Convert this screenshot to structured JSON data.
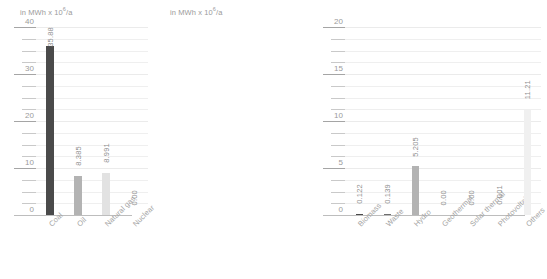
{
  "chart_data": [
    {
      "type": "bar",
      "title": "",
      "ylabel": "in MWh x 10⁶/a",
      "ylabel_prefix": "in MWh x 10",
      "ylabel_exp": "6",
      "ylabel_suffix": "/a",
      "xlabel": "",
      "ylim": [
        0,
        40
      ],
      "ymajor_step": 10,
      "yminor_step": 2.5,
      "grid": true,
      "legend": "none",
      "tick_labels": [
        "0",
        "10",
        "20",
        "30",
        "40"
      ],
      "categories": [
        "Coal",
        "Oil",
        "Natural gas",
        "Nuclear"
      ],
      "values": [
        35.88,
        8.385,
        8.991,
        0.0
      ],
      "value_labels": [
        "35.88",
        "8.385",
        "8.991",
        "0.00"
      ],
      "bar_colors": [
        "#4a4a4a",
        "#b3b3b3",
        "#e2e2e2",
        "#f2f2f2"
      ]
    },
    {
      "type": "bar",
      "title": "",
      "ylabel": "in MWh x 10⁶/a",
      "ylabel_prefix": "in MWh x 10",
      "ylabel_exp": "6",
      "ylabel_suffix": "/a",
      "xlabel": "",
      "ylim": [
        0,
        20
      ],
      "ymajor_step": 5,
      "yminor_step": 1.25,
      "grid": true,
      "legend": "none",
      "tick_labels": [
        "0",
        "5",
        "10",
        "15",
        "20"
      ],
      "categories": [
        "Biomass",
        "Waste",
        "Hydro",
        "Geothermal",
        "Solar thermal",
        "Photovoltaic",
        "Others"
      ],
      "values": [
        0.122,
        0.139,
        5.205,
        0.0,
        0.0,
        0.001,
        11.21
      ],
      "value_labels": [
        "0.122",
        "0.139",
        "5.205",
        "0.00",
        "0.00",
        "0.001",
        "11.21"
      ],
      "bar_colors": [
        "#4a4a4a",
        "#6e6e6e",
        "#b3b3b3",
        "#d8d8d8",
        "#e2e2e2",
        "#ededed",
        "#f0f0f0"
      ]
    }
  ]
}
